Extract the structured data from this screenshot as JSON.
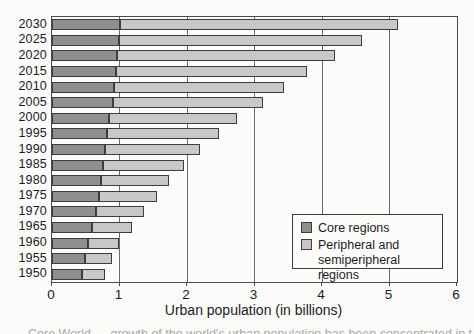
{
  "figure": {
    "background": "#fbfbf9",
    "caption_fragment": "Core World — growth of the world's urban population has been concentrated in the peripheral regions"
  },
  "legend": {
    "items": [
      {
        "label": "Core regions",
        "color": "#8f8f8f"
      },
      {
        "label": "Peripheral and semiperipheral regions",
        "color": "#c8c8c8"
      }
    ]
  },
  "chart_data": {
    "type": "bar",
    "orientation": "horizontal",
    "stacked": true,
    "title": "",
    "xlabel": "Urban population (in billions)",
    "ylabel": "",
    "xlim": [
      0,
      6
    ],
    "xticks": [
      "0",
      "1",
      "2",
      "3",
      "4",
      "5",
      "6"
    ],
    "grid": "vertical lines at each integer tick",
    "legend_position": "inside lower right",
    "categories": [
      "2030",
      "2025",
      "2020",
      "2015",
      "2010",
      "2005",
      "2000",
      "1995",
      "1990",
      "1985",
      "1980",
      "1975",
      "1970",
      "1965",
      "1960",
      "1955",
      "1950"
    ],
    "series": [
      {
        "name": "Core regions",
        "color": "#8f8f8f",
        "values": [
          1.0,
          0.99,
          0.97,
          0.95,
          0.92,
          0.9,
          0.85,
          0.82,
          0.78,
          0.75,
          0.72,
          0.69,
          0.65,
          0.59,
          0.54,
          0.49,
          0.45
        ]
      },
      {
        "name": "Peripheral and semiperipheral regions",
        "color": "#c8c8c8",
        "values": [
          4.13,
          3.6,
          3.22,
          2.83,
          2.51,
          2.23,
          1.89,
          1.66,
          1.42,
          1.2,
          1.02,
          0.86,
          0.71,
          0.59,
          0.46,
          0.4,
          0.34
        ]
      }
    ],
    "totals": [
      5.13,
      4.59,
      4.19,
      3.78,
      3.43,
      3.13,
      2.74,
      2.48,
      2.2,
      1.95,
      1.74,
      1.55,
      1.36,
      1.18,
      1.0,
      0.89,
      0.79
    ]
  }
}
